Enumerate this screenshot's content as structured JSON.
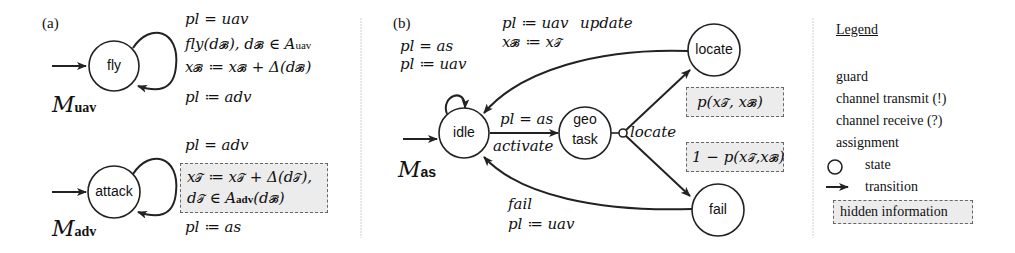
{
  "panel_a": {
    "tag": "(a)",
    "uav_model": {
      "name": "M",
      "subscript": "uav",
      "state": "fly",
      "guard": "pl = uav",
      "receive": "fly(d_B), d_B ∈ A_uav",
      "receive_main": "fly(d",
      "assignment": "x_B ≔ x_B + Δ(d_B)",
      "post_assignment": "pl ≔ adv"
    },
    "adv_model": {
      "name": "M",
      "subscript": "adv",
      "state": "attack",
      "guard": "pl = adv",
      "hidden_line1": "x_T ≔ x_T + Δ(d_T),",
      "hidden_line2": "d_T ∈ A_adv(d_B)",
      "post_assignment": "pl ≔ as"
    }
  },
  "panel_b": {
    "tag": "(b)",
    "model": {
      "name": "M",
      "subscript": "as"
    },
    "states": [
      "idle",
      "geo task",
      "locate",
      "fail"
    ],
    "state_geo_line1": "geo",
    "state_geo_line2": "task",
    "idle_self_loop": {
      "guard": "pl = as",
      "assignment": "pl ≔ uav"
    },
    "idle_to_geo": {
      "guard": "pl = as",
      "channel": "activate"
    },
    "geo_branch": {
      "channel": "locate"
    },
    "locate_to_idle": {
      "assignment1": "pl ≔ uav",
      "channel": "update",
      "assignment2": "x_B ≔ x_T"
    },
    "fail_to_idle": {
      "channel": "fail",
      "assignment": "pl ≔ uav"
    },
    "prob_locate": "p(x_T, x_B)",
    "prob_fail": "1 − p(x_T, x_B)"
  },
  "legend": {
    "title": "Legend",
    "items": [
      {
        "label": "guard",
        "icon": "none"
      },
      {
        "label": "channel transmit (!)",
        "icon": "none"
      },
      {
        "label": "channel receive (?)",
        "icon": "none"
      },
      {
        "label": "assignment",
        "icon": "none"
      },
      {
        "label": "state",
        "icon": "circle-icon"
      },
      {
        "label": "transition",
        "icon": "arrow-icon"
      },
      {
        "label": "hidden information",
        "icon": "dashed-box-icon"
      }
    ]
  },
  "colors": {
    "stroke": "#222222",
    "hidden_fill": "#ececec",
    "hidden_border": "#666666",
    "divider": "#cccccc"
  }
}
